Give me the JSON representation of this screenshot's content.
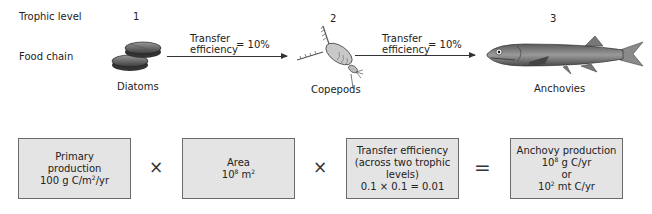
{
  "rows": {
    "trophic_level_label": "Trophic level",
    "food_chain_label": "Food chain"
  },
  "levels": [
    {
      "number": "1",
      "organism": "Diatoms",
      "icon": "diatom-icon"
    },
    {
      "number": "2",
      "organism": "Copepods",
      "icon": "copepod-icon"
    },
    {
      "number": "3",
      "organism": "Anchovies",
      "icon": "anchovy-fish-icon"
    }
  ],
  "transfers": [
    {
      "line1": "Transfer",
      "line2": "efficiency",
      "value": "= 10%"
    },
    {
      "line1": "Transfer",
      "line2": "efficiency",
      "value": "= 10%"
    }
  ],
  "equation": {
    "box1": {
      "line1": "Primary",
      "line2": "production",
      "line3_prefix": "100 g C/m",
      "line3_sup": "2",
      "line3_suffix": "/yr"
    },
    "op1": "×",
    "box2": {
      "line1": "Area",
      "line2_prefix": "10",
      "line2_sup": "8",
      "line2_unit": " m",
      "line2_unit_sup": "2"
    },
    "op2": "×",
    "box3": {
      "line1": "Transfer efficiency",
      "line2": "(across two trophic",
      "line3": "levels)",
      "line4": "0.1 × 0.1 = 0.01"
    },
    "op3": "=",
    "box4": {
      "line1": "Anchovy production",
      "line2_prefix": "10",
      "line2_sup": "8",
      "line2_suffix": " g C/yr",
      "line3": "or",
      "line4_prefix": "10",
      "line4_sup": "2",
      "line4_suffix": " mt C/yr"
    }
  },
  "colors": {
    "box_fill": "#e4e4e4",
    "box_border": "#6a6a6a",
    "text": "#222222"
  }
}
